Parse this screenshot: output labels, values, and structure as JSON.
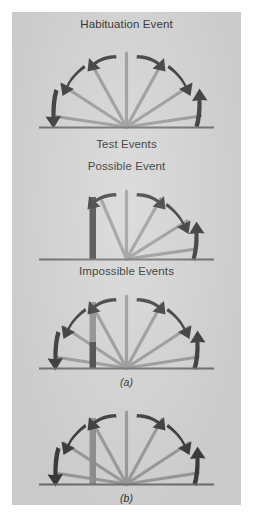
{
  "figure": {
    "background_color": "#ffffff",
    "plate_color": "#d5d5d5",
    "ray_color": "#9a9a9a",
    "baseline_color": "#6f6f6f",
    "arrow_color": "#3b3b3b",
    "block_dark_color": "#4a4a4a",
    "block_mid_color": "#8f8f8f",
    "text_color": "#2b2b2b"
  },
  "panels": [
    {
      "id": "habituation",
      "caption": "Habituation Event",
      "sublabel": "",
      "block": "none",
      "ray_count": 7,
      "arrow_count": 6
    },
    {
      "id": "possible-event",
      "caption": "Possible Event",
      "section_caption": "Test Events",
      "sublabel": "",
      "block": "tall-dark",
      "ray_count": 5,
      "arrow_count": 4
    },
    {
      "id": "impossible-event-a",
      "caption": "Impossible Events",
      "sublabel": "(a)",
      "block": "tall-two-tone",
      "ray_count": 7,
      "arrow_count": 6
    },
    {
      "id": "impossible-event-b",
      "caption": "",
      "sublabel": "(b)",
      "block": "tall-mid",
      "ray_count": 7,
      "arrow_count": 6
    }
  ],
  "captions": {
    "habituation_event": "Habituation Event",
    "test_events": "Test Events",
    "possible_event": "Possible Event",
    "impossible_events": "Impossible Events",
    "label_a": "(a)",
    "label_b": "(b)"
  }
}
